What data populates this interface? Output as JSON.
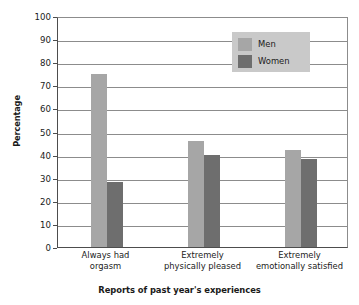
{
  "chart_data": {
    "type": "bar",
    "title": "",
    "subtitle": "",
    "xlabel": "Reports of past year's experiences",
    "ylabel": "Percentage",
    "categories": [
      "Always had\norgasm",
      "Extremely\nphysically pleased",
      "Extremely\nemotionally satisfied"
    ],
    "series": [
      {
        "name": "Men",
        "values": [
          75,
          46,
          42
        ],
        "color": "#a6a6a6"
      },
      {
        "name": "Women",
        "values": [
          28,
          40,
          38
        ],
        "color": "#6e6e6e"
      }
    ],
    "ylim": [
      0,
      100
    ],
    "ytick_step": 10,
    "yticks": [
      0,
      10,
      20,
      30,
      40,
      50,
      60,
      70,
      80,
      90,
      100
    ],
    "grid": true,
    "grid_axis": "y",
    "legend_position": "upper right",
    "legend_background": "#c9c9c9"
  },
  "axis": {
    "y_title": "Percentage",
    "x_title": "Reports of past year's experiences",
    "y_tick_labels": [
      "100",
      "90",
      "80",
      "70",
      "60",
      "50",
      "40",
      "30",
      "20",
      "10",
      "0"
    ]
  },
  "categories": [
    {
      "line1": "Always had",
      "line2": "orgasm"
    },
    {
      "line1": "Extremely",
      "line2": "physically pleased"
    },
    {
      "line1": "Extremely",
      "line2": "emotionally satisfied"
    }
  ],
  "legend": {
    "items": [
      {
        "label": "Men",
        "color": "#a6a6a6"
      },
      {
        "label": "Women",
        "color": "#6e6e6e"
      }
    ]
  }
}
